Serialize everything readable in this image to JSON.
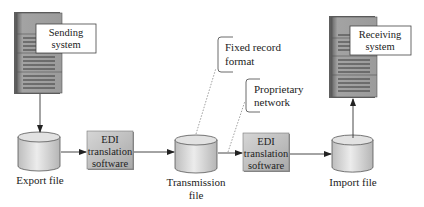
{
  "diagram": {
    "nodes": {
      "sending_system": {
        "label_lines": [
          "Sending",
          "system"
        ],
        "icon": "server-icon"
      },
      "receiving_system": {
        "label_lines": [
          "Receiving",
          "system"
        ],
        "icon": "server-icon"
      },
      "export_file": {
        "label_lines": [
          "Export file"
        ],
        "icon": "database-cylinder-icon"
      },
      "edi_left": {
        "label_lines": [
          "EDI",
          "translation",
          "software"
        ]
      },
      "transmission_file": {
        "label_lines": [
          "Transmission",
          "file"
        ],
        "icon": "database-cylinder-icon"
      },
      "edi_right": {
        "label_lines": [
          "EDI",
          "translation",
          "software"
        ]
      },
      "import_file": {
        "label_lines": [
          "Import file"
        ],
        "icon": "database-cylinder-icon"
      }
    },
    "callouts": {
      "fixed_record": {
        "label_lines": [
          "Fixed record",
          "format"
        ]
      },
      "proprietary_network": {
        "label_lines": [
          "Proprietary",
          "network"
        ]
      }
    },
    "edges": [
      {
        "from": "sending_system",
        "to": "export_file"
      },
      {
        "from": "export_file",
        "to": "edi_left"
      },
      {
        "from": "edi_left",
        "to": "transmission_file"
      },
      {
        "from": "transmission_file",
        "to": "edi_right"
      },
      {
        "from": "edi_right",
        "to": "import_file"
      },
      {
        "from": "import_file",
        "to": "receiving_system"
      }
    ],
    "colors": {
      "server_body": "#9a9a9a",
      "server_dark": "#5e5e5e",
      "box_fill": "#c8c8c8",
      "cylinder_fill": "#d8d8d8",
      "line": "#333333",
      "dotted": "#888888"
    }
  }
}
